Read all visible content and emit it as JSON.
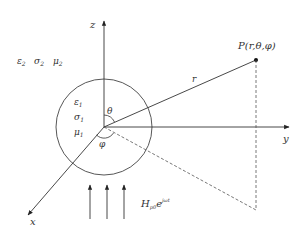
{
  "diagram": {
    "type": "spherical-coordinate-sketch",
    "axes": {
      "z": {
        "label": "z"
      },
      "y": {
        "label": "y"
      },
      "x": {
        "label": "x"
      }
    },
    "outer_medium": {
      "epsilon": "ε",
      "epsilon_sub": "2",
      "sigma": "σ",
      "sigma_sub": "2",
      "mu": "μ",
      "mu_sub": "2"
    },
    "inner_sphere": {
      "epsilon": "ε",
      "epsilon_sub": "1",
      "sigma": "σ",
      "sigma_sub": "1",
      "mu": "μ",
      "mu_sub": "1"
    },
    "angles": {
      "theta": "θ",
      "phi": "φ"
    },
    "point": {
      "label": "P(r,θ,φ)"
    },
    "radius_label": "r",
    "field": {
      "H": "H",
      "H_sub": "p0",
      "e": "e",
      "e_sup": "jωt",
      "arrow_count": 3
    },
    "colors": {
      "line": "#333333",
      "dashed": "#555555",
      "background": "#ffffff"
    }
  }
}
